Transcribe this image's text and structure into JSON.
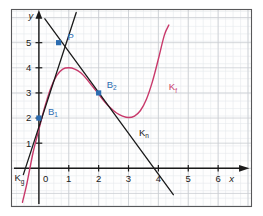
{
  "figure": {
    "background_color": "#ffffff",
    "panel_color": "#fefefe",
    "border_color": "#58585a",
    "grid_major_color": "#c9cdd2",
    "grid_minor_color": "#e6e9ec",
    "axis_color": "#1a1a1a",
    "curve_color": "#c8386a",
    "line_color": "#1a1a1a",
    "point_color": "#2b6cb0",
    "label_color": "#2b6cb0"
  },
  "axes": {
    "x_axis_label": "x",
    "y_axis_label": "y",
    "origin_label": "0",
    "x_ticks": [
      "1",
      "2",
      "3",
      "4",
      "5",
      "6"
    ],
    "y_ticks": [
      "1",
      "2",
      "3",
      "4",
      "5"
    ],
    "x_range": [
      -0.9,
      7.1
    ],
    "y_range": [
      -1.5,
      6.3
    ]
  },
  "curve_labels": [
    {
      "name": "curve-label-kf",
      "text": "K",
      "sub": "f",
      "x": 4.35,
      "y": 3.1,
      "color": "#c8386a"
    },
    {
      "name": "curve-label-kn",
      "text": "K",
      "sub": "n",
      "x": 3.35,
      "y": 1.3,
      "color": "#1a1a1a"
    },
    {
      "name": "curve-label-kg",
      "text": "K",
      "sub": "g",
      "x": -0.82,
      "y": -0.52,
      "color": "#1a1a1a"
    }
  ],
  "points": [
    {
      "name": "point-b1",
      "label": "B",
      "sub": "1",
      "x": 0,
      "y": 2,
      "label_dx": 9,
      "label_dy": -3
    },
    {
      "name": "point-b2",
      "label": "B",
      "sub": "2",
      "x": 2,
      "y": 3,
      "label_dx": 8,
      "label_dy": -5
    },
    {
      "name": "point-p",
      "label": "P",
      "sub": "",
      "x": 0.66,
      "y": 5,
      "label_dx": 9,
      "label_dy": -3
    }
  ],
  "chart_data": {
    "type": "line",
    "title": "",
    "xlabel": "x",
    "ylabel": "y",
    "xlim": [
      -0.9,
      7.1
    ],
    "ylim": [
      -1.5,
      6.3
    ],
    "grid": true,
    "legend": "none",
    "series": [
      {
        "name": "K_f",
        "kind": "curve",
        "color": "#c8386a",
        "label": "K_f",
        "description": "cubic-like curve, local maximum near (1, 4), local minimum near (3, 2), rising steeply after x=3.6",
        "x": [
          -0.55,
          -0.4,
          -0.2,
          0.0,
          0.2,
          0.4,
          0.6,
          0.8,
          1.0,
          1.2,
          1.4,
          1.6,
          1.8,
          2.0,
          2.2,
          2.4,
          2.6,
          2.8,
          3.0,
          3.2,
          3.4,
          3.6,
          3.8,
          4.0,
          4.2,
          4.35
        ],
        "y": [
          -1.35,
          -0.6,
          0.6,
          1.55,
          2.45,
          3.2,
          3.7,
          3.95,
          4.0,
          3.95,
          3.8,
          3.55,
          3.25,
          2.95,
          2.65,
          2.4,
          2.2,
          2.08,
          2.02,
          2.08,
          2.3,
          2.75,
          3.45,
          4.35,
          5.3,
          5.7
        ]
      },
      {
        "name": "K_g",
        "kind": "line",
        "color": "#1a1a1a",
        "label": "K_g",
        "description": "tangent line through B1 (0,2) and P",
        "points": [
          [
            -0.52,
            -0.25
          ],
          [
            1.25,
            6.2
          ]
        ]
      },
      {
        "name": "K_n",
        "kind": "line",
        "color": "#1a1a1a",
        "label": "K_n",
        "description": "normal line through P and B2 (2,3), x-intercept at x=4",
        "points": [
          [
            0.2,
            5.95
          ],
          [
            4.5,
            -1.05
          ]
        ]
      }
    ],
    "annotated_points": [
      {
        "label": "B_1",
        "x": 0,
        "y": 2
      },
      {
        "label": "B_2",
        "x": 2,
        "y": 3
      },
      {
        "label": "P",
        "x": 0.66,
        "y": 5
      }
    ]
  }
}
